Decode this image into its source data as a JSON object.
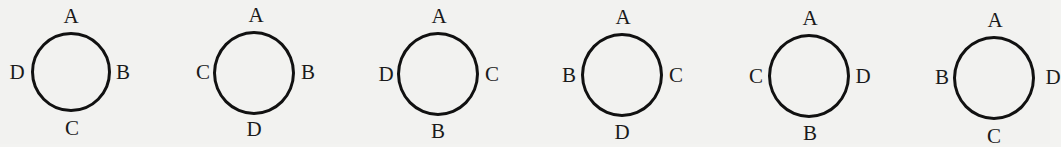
{
  "diagram": {
    "circles": [
      {
        "cx": 71,
        "cy": 72,
        "r": 40,
        "top": "A",
        "right": "B",
        "bottom": "C",
        "left": "D"
      },
      {
        "cx": 255,
        "cy": 73,
        "r": 40,
        "top": "A",
        "right": "B",
        "bottom": "D",
        "left": "C"
      },
      {
        "cx": 438,
        "cy": 75,
        "r": 40,
        "top": "A",
        "right": "C",
        "bottom": "B",
        "left": "D"
      },
      {
        "cx": 622,
        "cy": 76,
        "r": 40,
        "top": "A",
        "right": "C",
        "bottom": "D",
        "left": "B"
      },
      {
        "cx": 810,
        "cy": 77,
        "r": 40,
        "top": "A",
        "right": "D",
        "bottom": "B",
        "left": "C"
      },
      {
        "cx": 995,
        "cy": 78,
        "r": 40,
        "top": "A",
        "right": "D",
        "bottom": "C",
        "left": "B"
      }
    ],
    "stroke_color": "#111111",
    "background_color": "#f2f2f0"
  }
}
